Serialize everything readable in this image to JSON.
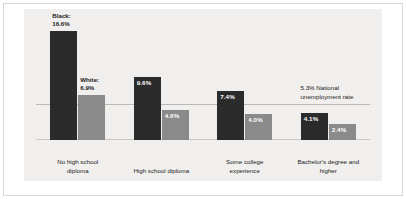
{
  "chart_data": {
    "type": "bar",
    "title": "",
    "subtitle": "",
    "xlabel": "",
    "ylabel": "",
    "ylim": [
      0,
      18.5
    ],
    "grid": false,
    "legend_position": "inline-above-first-group",
    "categories": [
      "No high school\ndiploma",
      "High school diploma",
      "Some college\nexperience",
      "Bachelor's degree and\nhigher"
    ],
    "series": [
      {
        "name": "Black:",
        "color": "#2b2b2b",
        "values": [
          16.6,
          9.6,
          7.4,
          4.1
        ],
        "value_labels": [
          "16.6%",
          "9.6%",
          "7.4%",
          "4.1%"
        ]
      },
      {
        "name": "White:",
        "color": "#8a8a8a",
        "values": [
          6.9,
          4.6,
          4.0,
          2.4
        ],
        "value_labels": [
          "6.9%",
          "4.6%",
          "4.0%",
          "2.4%"
        ]
      }
    ],
    "reference_line": {
      "value": 5.3,
      "label": "5.3% National\nunemployment rate",
      "color": "#bab8b5"
    }
  },
  "colors": {
    "page_background": "#ffffff",
    "panel_background": "#f0efed",
    "frame_border": "#d9d7d4",
    "series_black": "#2b2b2b",
    "series_white": "#8a8a8a",
    "axis_line": "#c9c7c4",
    "text": "#1a1a1a",
    "value_label_text": "#ffffff"
  }
}
